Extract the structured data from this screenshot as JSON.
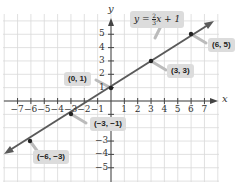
{
  "chart_data": {
    "type": "line",
    "title": "",
    "equation": "y = ⅔x + 1",
    "xlabel": "x",
    "ylabel": "y",
    "xlim": [
      -7,
      7
    ],
    "ylim": [
      -5,
      5
    ],
    "grid": true,
    "x_ticks": [
      "-7",
      "-6",
      "-5",
      "-4",
      "-3",
      "-2",
      "-1",
      "1",
      "2",
      "3",
      "4",
      "5",
      "6",
      "7"
    ],
    "y_ticks": [
      "5",
      "4",
      "3",
      "2",
      "1",
      "-1",
      "-3",
      "-4",
      "-5"
    ],
    "series": [
      {
        "name": "y = (2/3)x + 1",
        "slope": 0.6667,
        "intercept": 1,
        "points": [
          {
            "x": -6,
            "y": -3,
            "label": "(−6, −3)"
          },
          {
            "x": -3,
            "y": -1,
            "label": "(−3, −1)"
          },
          {
            "x": 0,
            "y": 1,
            "label": "(0, 1)"
          },
          {
            "x": 3,
            "y": 3,
            "label": "(3, 3)"
          },
          {
            "x": 6,
            "y": 5,
            "label": "(6, 5)"
          }
        ]
      }
    ],
    "colors": {
      "line": "#555555",
      "grid": "#d6d6d6",
      "label_bg": "#dcdcdc"
    }
  },
  "labels": {
    "equation_prefix": "y = ",
    "equation_num": "2",
    "equation_den": "3",
    "equation_suffix": "x + 1",
    "p1": "(0, 1)",
    "p2": "(3, 3)",
    "p3": "(6, 5)",
    "p4": "(−3, −1)",
    "p5": "(−6, −3)",
    "x_axis": "x",
    "y_axis": "y"
  },
  "ticks": {
    "xneg": [
      "−7",
      "−6",
      "−5",
      "−4",
      "−3",
      "−2",
      "−1"
    ],
    "xpos": [
      "1",
      "2",
      "3",
      "4",
      "5",
      "6",
      "7"
    ],
    "ypos": [
      "5",
      "4",
      "3",
      "2",
      "1"
    ],
    "yneg": [
      "−3",
      "−4",
      "−5"
    ]
  }
}
